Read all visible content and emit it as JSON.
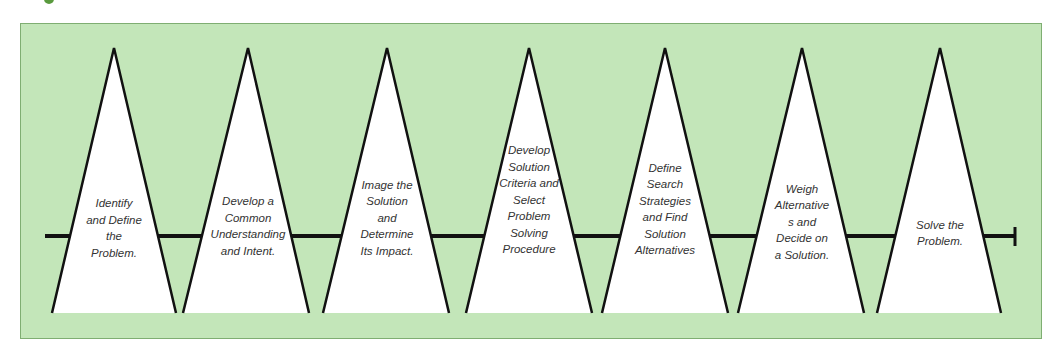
{
  "figure": {
    "background_color": "#c3e6b9",
    "timeline_color": "#111111",
    "steps": [
      {
        "label": "Identify and Define the Problem.",
        "lines": [
          "Identify",
          "and Define",
          "the",
          "Problem."
        ]
      },
      {
        "label": "Develop a Common Understanding and Intent.",
        "lines": [
          "Develop a",
          "Common",
          "Understanding",
          "and Intent."
        ]
      },
      {
        "label": "Image the Solution and Determine Its Impact.",
        "lines": [
          "Image the",
          "Solution",
          "and",
          "Determine",
          "Its Impact."
        ]
      },
      {
        "label": "Develop Solution Criteria and Select Problem Solving Procedure",
        "lines": [
          "Develop",
          "Solution",
          "Criteria and",
          "Select",
          "Problem",
          "Solving",
          "Procedure"
        ]
      },
      {
        "label": "Define Search Strategies and Find Solution Alternatives",
        "lines": [
          "Define",
          "Search",
          "Strategies",
          "and Find",
          "Solution",
          "Alternatives"
        ]
      },
      {
        "label": "Weigh Alternatives and Decide on a Solution.",
        "lines": [
          "Weigh",
          "Alternative",
          "s and",
          "Decide on",
          "a Solution."
        ]
      },
      {
        "label": "Solve the Problem.",
        "lines": [
          "Solve the",
          "Problem."
        ]
      }
    ]
  }
}
